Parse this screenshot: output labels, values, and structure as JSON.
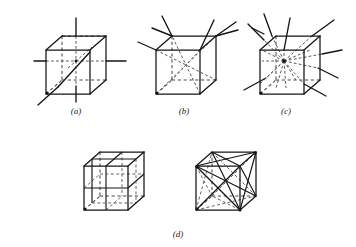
{
  "figure": {
    "caption_style": "italic-parenthetical",
    "background_color": "#ffffff",
    "line_color": "#141414",
    "hidden_line_color": "#5a5a5a",
    "width": 356,
    "height": 247
  },
  "panels": [
    {
      "id": "a",
      "label": "(a)",
      "description": "cube with three four-fold rotation axes through opposite face centres and one body-diagonal axis",
      "axis_count": 4,
      "axis_type": "4-fold through face centres",
      "center_x": 88,
      "center_y": 62
    },
    {
      "id": "b",
      "label": "(b)",
      "description": "cube with four three-fold rotation axes along the body diagonals through opposite corners",
      "axis_count": 4,
      "axis_type": "3-fold through body diagonals",
      "center_x": 188,
      "center_y": 62
    },
    {
      "id": "c",
      "label": "(c)",
      "description": "cube with six two-fold rotation axes through the midpoints of opposite edges",
      "axis_count": 6,
      "axis_type": "2-fold through opposite edge midpoints",
      "center_x": 292,
      "center_y": 62
    },
    {
      "id": "d",
      "label": "(d)",
      "description": "cubes showing mirror planes: three planes parallel to the faces and six diagonal planes through opposite edges",
      "axis_count": 9,
      "axis_type": "mirror planes",
      "center_x": 178,
      "center_y": 186
    }
  ],
  "sub_figures": [
    {
      "parent": "d",
      "position": "left",
      "description": "three mirror planes parallel to the cube faces"
    },
    {
      "parent": "d",
      "position": "right",
      "description": "six diagonal mirror planes containing opposite edges"
    }
  ],
  "geometry": {
    "cube_front_width": 44,
    "cube_front_height": 44,
    "depth_offset_x": 16,
    "depth_offset_y": -14,
    "projection": "oblique cabinet-like"
  }
}
